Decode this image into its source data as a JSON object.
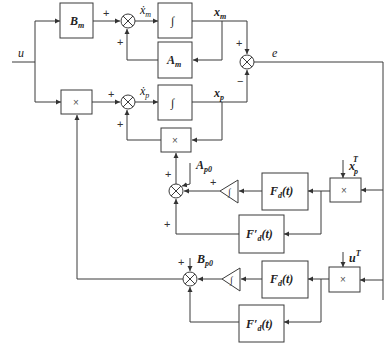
{
  "diagram": {
    "type": "block-diagram",
    "inputs": {
      "u": "u"
    },
    "blocks": {
      "Bm": {
        "label": "B",
        "sub": "m"
      },
      "Am": {
        "label": "A",
        "sub": "m"
      },
      "int_m": {
        "label": "∫"
      },
      "int_p": {
        "label": "∫"
      },
      "mult_u": {
        "label": "×"
      },
      "mult_x": {
        "label": "×"
      },
      "mult_A": {
        "label": "×"
      },
      "mult_B": {
        "label": "×"
      },
      "Fd_A": {
        "label": "F",
        "sub": "d",
        "arg": "(t)"
      },
      "Fdp_A": {
        "label": "F′",
        "sub": "d",
        "arg": "(t)"
      },
      "Fd_B": {
        "label": "F",
        "sub": "d",
        "arg": "(t)"
      },
      "Fdp_B": {
        "label": "F′",
        "sub": "d",
        "arg": "(t)"
      },
      "gain_A": {
        "label": "∫"
      },
      "gain_B": {
        "label": "∫"
      }
    },
    "signals": {
      "xm_dot": {
        "label": "ẋ",
        "sub": "m"
      },
      "xp_dot": {
        "label": "ẋ",
        "sub": "p"
      },
      "xm": {
        "label": "x",
        "sub": "m"
      },
      "xp": {
        "label": "x",
        "sub": "p"
      },
      "e": "e",
      "Ap0": {
        "label": "A",
        "sub": "p0"
      },
      "Bp0": {
        "label": "B",
        "sub": "p0"
      },
      "xpT": {
        "label": "x",
        "sub": "p",
        "sup": "T"
      },
      "uT": {
        "label": "u",
        "sup": "T"
      }
    },
    "signs": {
      "plus": "+",
      "minus": "−"
    }
  }
}
